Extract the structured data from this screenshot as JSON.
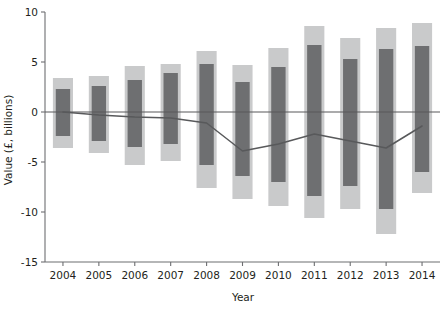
{
  "chart_data": {
    "type": "bar",
    "title": "",
    "subtitle": "",
    "xlabel": "Year",
    "ylabel": "Value (£, billions)",
    "categories": [
      "2004",
      "2005",
      "2006",
      "2007",
      "2008",
      "2009",
      "2010",
      "2011",
      "2012",
      "2013",
      "2014"
    ],
    "ylim": [
      -15,
      10
    ],
    "xlim_note": "categorical, 11 year positions",
    "yticks": [
      10,
      5,
      0,
      -5,
      -10,
      -15
    ],
    "ytick_labels": [
      "10",
      "5",
      "0",
      "-5",
      "-10",
      "-15"
    ],
    "grid": false,
    "legend": "none",
    "zero_line": 0,
    "series": [
      {
        "name": "outer-range-light",
        "style": "bar-band-light",
        "color": "#c9cacb",
        "upper": [
          3.4,
          3.6,
          4.6,
          4.8,
          6.1,
          4.7,
          6.4,
          8.6,
          7.4,
          8.4,
          8.9
        ],
        "lower": [
          -3.6,
          -4.1,
          -5.3,
          -4.9,
          -7.6,
          -8.7,
          -9.4,
          -10.6,
          -9.7,
          -12.2,
          -8.1
        ]
      },
      {
        "name": "inner-range-dark",
        "style": "bar-band-dark",
        "color": "#6e6f71",
        "upper": [
          2.3,
          2.6,
          3.2,
          3.9,
          4.8,
          3.0,
          4.5,
          6.7,
          5.3,
          6.3,
          6.6
        ],
        "lower": [
          -2.4,
          -2.9,
          -3.5,
          -3.2,
          -5.3,
          -6.4,
          -7.0,
          -8.4,
          -7.4,
          -9.7,
          -6.0
        ]
      },
      {
        "name": "central-estimate-line",
        "style": "line",
        "color": "#58595b",
        "values": [
          0.0,
          -0.3,
          -0.5,
          -0.6,
          -1.1,
          -3.9,
          -3.2,
          -2.2,
          -2.9,
          -3.6,
          -1.4
        ]
      }
    ]
  },
  "axes": {
    "y_label": "Value (£, billions)",
    "x_label": "Year"
  }
}
